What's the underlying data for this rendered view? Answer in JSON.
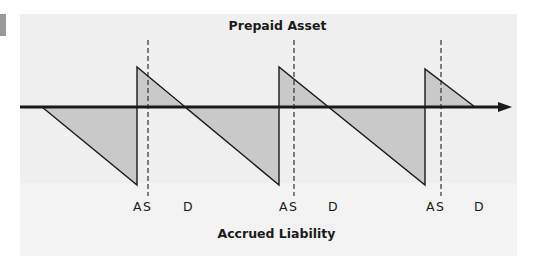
{
  "diagram": {
    "top_label": "Prepaid Asset",
    "bottom_label": "Accrued Liability",
    "axis": {
      "y": 107,
      "x_start": 20,
      "x_end": 510,
      "direction": "right-arrow"
    },
    "colors": {
      "panel": "#efefef",
      "shade": "#c9c9c9",
      "line": "#1a1a1a",
      "tab": "#9a9a9a"
    },
    "cycles": [
      {
        "markers": {
          "A": "A",
          "S": "S",
          "D": "D"
        }
      },
      {
        "markers": {
          "A": "A",
          "S": "S",
          "D": "D"
        }
      },
      {
        "markers": {
          "A": "A",
          "S": "S",
          "D": "D"
        }
      }
    ],
    "marker_labels": {
      "c1_a": "A",
      "c1_s": "S",
      "c1_d": "D",
      "c2_a": "A",
      "c2_s": "S",
      "c2_d": "D",
      "c3_a": "A",
      "c3_s": "S",
      "c3_d": "D"
    },
    "legend_semantics": {
      "A": "accrual / adjustment point",
      "S": "settlement point (dashed line)",
      "D": "date marker"
    }
  }
}
